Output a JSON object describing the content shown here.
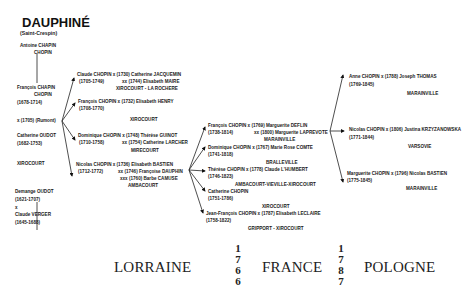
{
  "header": {
    "title": "DAUPHINÉ",
    "subtitle": "(Saint-Crespin)"
  },
  "ancestors": [
    {
      "line1": "Antoine CHAPIN",
      "line2": "CHOPIN"
    },
    {
      "line1": "François CHAPIN",
      "line2": "CHOPIN",
      "dates": "(1678-1714)"
    },
    {
      "marriage": "x (1705) (Rumont)"
    },
    {
      "line1": "Catherine OUDOT",
      "dates": "(1682-1753)"
    },
    {
      "place": "XIROCOURT"
    },
    {
      "line1": "Demange OUDOT",
      "dates": "(1621-1707)",
      "x": "x",
      "spouse": "Claude VERGER",
      "spouse_dates": "(1645-1688)"
    }
  ],
  "generation2": [
    {
      "line1": "Claude CHOPIN x (1730) Catherine JACQUEMIN",
      "dates": "(1705-1749)",
      "line2": "xx (1744) Elisabeth MAIRE",
      "place": "XIROCOURT - LA ROCHERE"
    },
    {
      "line1": "François CHOPIN x (1732) Elisabeth HENRY",
      "dates": "(1708-1770)",
      "place": "XIROCOURT"
    },
    {
      "line1": "Dominique CHOPIN x (1748) Thérèse GUINOT",
      "dates": "(1710-1758)",
      "line2": "xx (1754) Catherine LARCHER",
      "place": "MIRECOURT"
    },
    {
      "line1": "Nicolas CHOPIN x (1736) Elisabeth BASTIEN",
      "dates": "(1712-1772)",
      "line2": "xx (1746) Françoise DAUPHIN",
      "line3": "xxx (1760) Barbe CAMUSE",
      "place": "AMBACOURT"
    }
  ],
  "generation3": [
    {
      "line1": "François CHOPIN x (1769) Marguerite DEFLIN",
      "dates": "(1738-1814)",
      "line2": "xx (1800) Marguerite LAPREVOTE",
      "place": "MARAINVILLE"
    },
    {
      "line1": "Dominique CHOPIN x (1767) Marie Rose COMTE",
      "dates": "(1741-1818)",
      "place": "BRALLEVILLE"
    },
    {
      "line1": "Thérèse CHOPIN x (1778) Claude L'HUMBERT",
      "dates": "(1746-1823)",
      "place": "AMBACOURT-VIEVILLE-XIROCOURT"
    },
    {
      "line1": "Catherine CHOPIN",
      "dates": "(1751-1786)",
      "place": "XIROCOURT"
    },
    {
      "line1": "Jean-François CHOPIN x (1787) Elisabeth LECLAIRE",
      "dates": "(1758-1822)",
      "place": "GRIPPORT - XIROCOURT"
    }
  ],
  "generation4": [
    {
      "line1": "Anne CHOPIN x (1788) Joseph THOMAS",
      "dates": "(1769-1845)",
      "place": "MARAINVILLE"
    },
    {
      "line1": "Nicolas CHOPIN x (1806) Justina KRZYZANOWSKA",
      "dates": "(1771-1844)",
      "place": "VARSOVIE"
    },
    {
      "line1": "Marguerite CHOPIN x (1796) Nicolas BASTIEN",
      "dates": "(1775-1845)",
      "place": "MARAINVILLE"
    }
  ],
  "footer": {
    "regions": [
      "LORRAINE",
      "FRANCE",
      "POLOGNE"
    ],
    "year1": [
      "1",
      "7",
      "6",
      "6"
    ],
    "year2": [
      "1",
      "7",
      "8",
      "7"
    ]
  }
}
